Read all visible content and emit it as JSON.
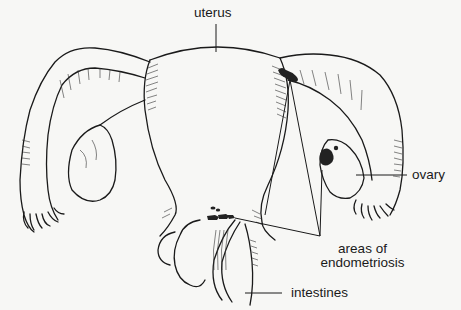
{
  "diagram": {
    "type": "anatomical-illustration",
    "labels": {
      "uterus": "uterus",
      "ovary": "ovary",
      "endometriosis_line1": "areas of",
      "endometriosis_line2": "endometriosis",
      "intestines": "intestines"
    },
    "colors": {
      "background": "#f7f7f5",
      "ink": "#1a1a1a",
      "lesion": "#222222"
    }
  }
}
